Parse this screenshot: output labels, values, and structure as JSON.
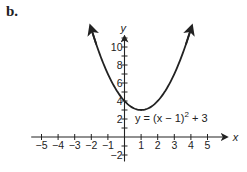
{
  "part_label": "b.",
  "chart_data": {
    "type": "line",
    "title": "",
    "function": "y = (x - 1)^2 + 3",
    "annotation": {
      "text_prefix": "y = (x − 1)",
      "superscript": "2",
      "text_suffix": " + 3"
    },
    "xlabel": "x",
    "ylabel": "y",
    "xlim": [
      -5.5,
      5.8
    ],
    "ylim": [
      -2.5,
      11.5
    ],
    "x_ticks": [
      -5,
      -4,
      -3,
      -2,
      -1,
      1,
      2,
      3,
      4,
      5
    ],
    "x_tick_labels": [
      "−5",
      "−4",
      "−3",
      "−2",
      "−1",
      "1",
      "2",
      "3",
      "4",
      "5"
    ],
    "y_ticks": [
      -2,
      2,
      4,
      6,
      8,
      10
    ],
    "y_tick_labels": [
      "−2",
      "2",
      "4",
      "6",
      "8",
      "10"
    ],
    "vertex": [
      1,
      3
    ],
    "y_intercept": [
      0,
      4
    ],
    "series": [
      {
        "name": "y = (x − 1)^2 + 3",
        "x": [
          -2,
          -1,
          0,
          1,
          2,
          3,
          4
        ],
        "y": [
          12,
          7,
          4,
          3,
          4,
          7,
          12
        ]
      }
    ],
    "grid": false,
    "legend": "none"
  },
  "colors": {
    "ink": "#222222",
    "background": "#ffffff"
  }
}
